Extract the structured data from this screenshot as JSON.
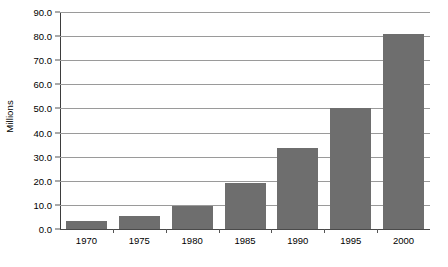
{
  "chart_data": {
    "type": "bar",
    "title": "",
    "subtitle": "",
    "xlabel": "",
    "ylabel": "Millions",
    "categories": [
      "1970",
      "1975",
      "1980",
      "1985",
      "1990",
      "1995",
      "2000"
    ],
    "values": [
      3.5,
      5.5,
      9.5,
      19.0,
      33.5,
      50.0,
      81.0
    ],
    "series": [
      {
        "name": "Millions",
        "values": [
          3.5,
          5.5,
          9.5,
          19.0,
          33.5,
          50.0,
          81.0
        ]
      }
    ],
    "ylim": [
      0.0,
      90.0
    ],
    "ytick_labels": [
      "0.0",
      "10.0",
      "20.0",
      "30.0",
      "40.0",
      "50.0",
      "60.0",
      "70.0",
      "80.0",
      "90.0"
    ],
    "ytick_values": [
      0.0,
      10.0,
      20.0,
      30.0,
      40.0,
      50.0,
      60.0,
      70.0,
      80.0,
      90.0
    ],
    "grid": true,
    "grid_axis": "y",
    "legend": false,
    "legend_position": "none",
    "annotations": [],
    "bar_color": "#6e6e6e",
    "gridline_color": "#9a9a9a",
    "axis_color": "#3d3d3d",
    "background_color": "#ffffff",
    "text_color": "#000000"
  }
}
